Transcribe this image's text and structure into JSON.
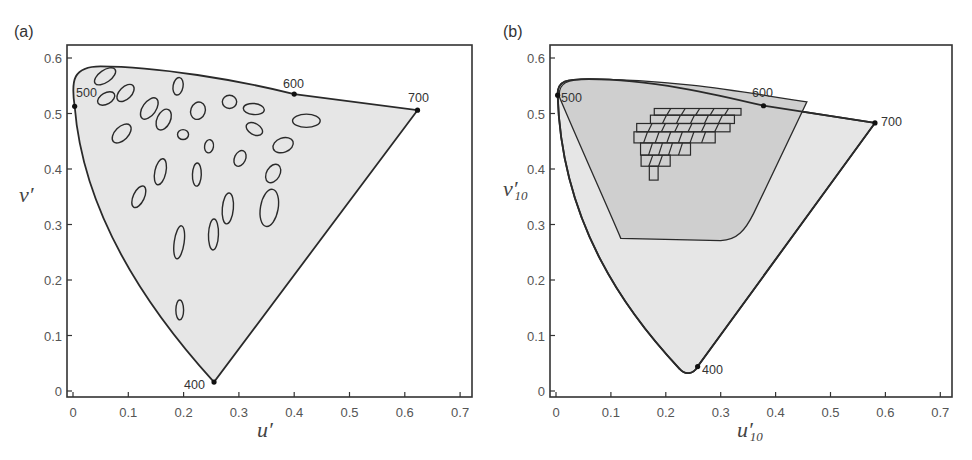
{
  "chart_data": [
    {
      "type": "scatter",
      "panel": "(a)",
      "title": "",
      "xlabel": "u′",
      "ylabel": "v′",
      "xlim": [
        0,
        0.7
      ],
      "ylim": [
        0,
        0.6
      ],
      "xticks": [
        "0",
        "0.1",
        "0.2",
        "0.3",
        "0.4",
        "0.5",
        "0.6",
        "0.7"
      ],
      "yticks": [
        "0",
        "0.1",
        "0.2",
        "0.3",
        "0.4",
        "0.5",
        "0.6"
      ],
      "grid": false,
      "spectral_locus_markers": [
        {
          "label": "400",
          "u": 0.255,
          "v": 0.016
        },
        {
          "label": "500",
          "u": 0.003,
          "v": 0.513
        },
        {
          "label": "600",
          "u": 0.4,
          "v": 0.535
        },
        {
          "label": "700",
          "u": 0.623,
          "v": 0.506
        }
      ],
      "annotation": "MacAdam ellipses (25) plotted inside the spectral locus",
      "ellipses": [
        {
          "u": 0.058,
          "v": 0.567,
          "ru": 0.022,
          "rv": 0.011,
          "angle": 35
        },
        {
          "u": 0.06,
          "v": 0.527,
          "ru": 0.017,
          "rv": 0.01,
          "angle": 30
        },
        {
          "u": 0.095,
          "v": 0.537,
          "ru": 0.019,
          "rv": 0.011,
          "angle": 45
        },
        {
          "u": 0.088,
          "v": 0.464,
          "ru": 0.021,
          "rv": 0.012,
          "angle": 45
        },
        {
          "u": 0.138,
          "v": 0.509,
          "ru": 0.022,
          "rv": 0.012,
          "angle": 55
        },
        {
          "u": 0.164,
          "v": 0.489,
          "ru": 0.02,
          "rv": 0.012,
          "angle": 65
        },
        {
          "u": 0.19,
          "v": 0.549,
          "ru": 0.016,
          "rv": 0.009,
          "angle": 80
        },
        {
          "u": 0.199,
          "v": 0.462,
          "ru": 0.01,
          "rv": 0.009,
          "angle": 0
        },
        {
          "u": 0.226,
          "v": 0.505,
          "ru": 0.016,
          "rv": 0.013,
          "angle": 70
        },
        {
          "u": 0.246,
          "v": 0.441,
          "ru": 0.012,
          "rv": 0.008,
          "angle": 80
        },
        {
          "u": 0.283,
          "v": 0.521,
          "ru": 0.013,
          "rv": 0.012,
          "angle": 0
        },
        {
          "u": 0.327,
          "v": 0.508,
          "ru": 0.019,
          "rv": 0.01,
          "angle": -5
        },
        {
          "u": 0.328,
          "v": 0.472,
          "ru": 0.016,
          "rv": 0.01,
          "angle": -30
        },
        {
          "u": 0.422,
          "v": 0.487,
          "ru": 0.025,
          "rv": 0.012,
          "angle": 0
        },
        {
          "u": 0.38,
          "v": 0.443,
          "ru": 0.019,
          "rv": 0.013,
          "angle": 20
        },
        {
          "u": 0.302,
          "v": 0.419,
          "ru": 0.015,
          "rv": 0.01,
          "angle": 65
        },
        {
          "u": 0.362,
          "v": 0.392,
          "ru": 0.018,
          "rv": 0.012,
          "angle": 60
        },
        {
          "u": 0.158,
          "v": 0.395,
          "ru": 0.024,
          "rv": 0.01,
          "angle": 78
        },
        {
          "u": 0.224,
          "v": 0.39,
          "ru": 0.021,
          "rv": 0.008,
          "angle": 88
        },
        {
          "u": 0.119,
          "v": 0.35,
          "ru": 0.021,
          "rv": 0.01,
          "angle": 65
        },
        {
          "u": 0.28,
          "v": 0.329,
          "ru": 0.028,
          "rv": 0.01,
          "angle": 85
        },
        {
          "u": 0.355,
          "v": 0.33,
          "ru": 0.034,
          "rv": 0.016,
          "angle": 80
        },
        {
          "u": 0.192,
          "v": 0.268,
          "ru": 0.03,
          "rv": 0.009,
          "angle": 82
        },
        {
          "u": 0.254,
          "v": 0.282,
          "ru": 0.028,
          "rv": 0.009,
          "angle": 88
        },
        {
          "u": 0.193,
          "v": 0.146,
          "ru": 0.018,
          "rv": 0.007,
          "angle": 90
        }
      ]
    },
    {
      "type": "scatter",
      "panel": "(b)",
      "title": "",
      "xlabel": "u′10",
      "ylabel": "v′10",
      "xlim": [
        0,
        0.7
      ],
      "ylim": [
        0,
        0.6
      ],
      "xticks": [
        "0",
        "0.1",
        "0.2",
        "0.3",
        "0.4",
        "0.5",
        "0.6",
        "0.7"
      ],
      "yticks": [
        "0",
        "0.1",
        "0.2",
        "0.3",
        "0.4",
        "0.5",
        "0.6"
      ],
      "grid": false,
      "spectral_locus_markers": [
        {
          "label": "400",
          "u": 0.258,
          "v": 0.044
        },
        {
          "label": "500",
          "u": 0.003,
          "v": 0.533
        },
        {
          "label": "600",
          "u": 0.378,
          "v": 0.514
        },
        {
          "label": "700",
          "u": 0.581,
          "v": 0.483
        }
      ],
      "annotation": "Inner darker gamut region with a distorted grid of cells",
      "inner_region": [
        [
          0.01,
          0.53
        ],
        [
          0.12,
          0.275
        ],
        [
          0.3,
          0.27
        ],
        [
          0.345,
          0.3
        ],
        [
          0.456,
          0.52
        ]
      ],
      "grid_rows": [
        {
          "v_top": 0.509,
          "v_bottom": 0.497,
          "u_start": 0.179,
          "u_end": 0.337,
          "cells": 6
        },
        {
          "v_top": 0.497,
          "v_bottom": 0.482,
          "u_start": 0.172,
          "u_end": 0.325,
          "cells": 6
        },
        {
          "v_top": 0.482,
          "v_bottom": 0.467,
          "u_start": 0.147,
          "u_end": 0.317,
          "cells": 7
        },
        {
          "v_top": 0.467,
          "v_bottom": 0.447,
          "u_start": 0.142,
          "u_end": 0.29,
          "cells": 7
        },
        {
          "v_top": 0.447,
          "v_bottom": 0.425,
          "u_start": 0.154,
          "u_end": 0.245,
          "cells": 5
        },
        {
          "v_top": 0.425,
          "v_bottom": 0.405,
          "u_start": 0.155,
          "u_end": 0.208,
          "cells": 3
        },
        {
          "v_top": 0.405,
          "v_bottom": 0.38,
          "u_start": 0.17,
          "u_end": 0.186,
          "cells": 1
        }
      ]
    }
  ],
  "panels": {
    "a": {
      "label": "(a)",
      "xlabel_main": "u",
      "xlabel_prime": "′",
      "ylabel_main": "v",
      "ylabel_prime": "′",
      "wl": {
        "w400": "400",
        "w500": "500",
        "w600": "600",
        "w700": "700"
      }
    },
    "b": {
      "label": "(b)",
      "xlabel_main": "u",
      "xlabel_prime": "′",
      "xlabel_sub": "10",
      "ylabel_main": "v",
      "ylabel_prime": "′",
      "ylabel_sub": "10",
      "wl": {
        "w400": "400",
        "w500": "500",
        "w600": "600",
        "w700": "700"
      }
    }
  },
  "colors": {
    "locus_fill": "#e6e6e6",
    "inner_fill": "#cfcfcf",
    "stroke": "#2a2a2a",
    "axis": "#333333",
    "text": "#555555"
  }
}
